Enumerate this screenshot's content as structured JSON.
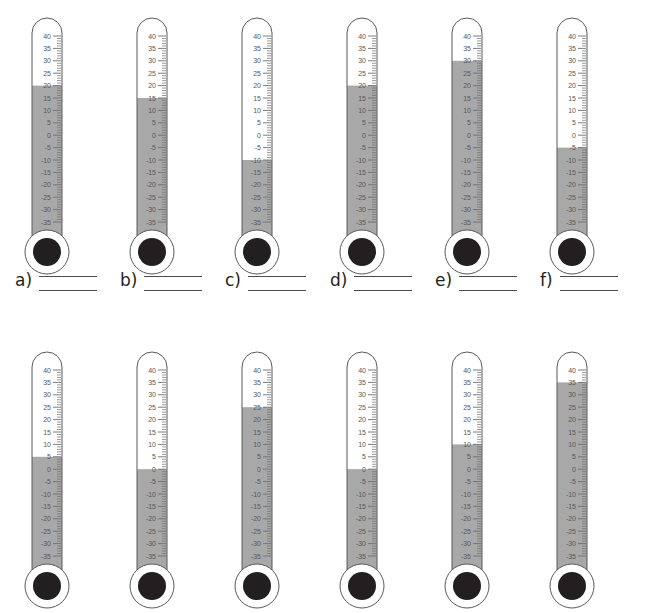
{
  "page": {
    "background_color": "#ffffff"
  },
  "style": {
    "mercury_color": "#a8a8a8",
    "outline_color": "#58595b",
    "tick_color": "#6d6e71",
    "label_color": "#58595b",
    "bulb_fill_color": "#231f20",
    "line_color": "#4a4a4a"
  },
  "scale": {
    "max": 40,
    "min": -35,
    "major_step": 5,
    "minor_per_major": 5,
    "labels": [
      "40",
      "35",
      "30",
      "25",
      "20",
      "15",
      "10",
      "5",
      "0",
      "-5",
      "-10",
      "-15",
      "-20",
      "-25",
      "-30",
      "-35"
    ],
    "unit": "degrees"
  },
  "rows": [
    {
      "name": "row-1",
      "thermometers": [
        {
          "id": "a",
          "letter": "a)",
          "reading": 20
        },
        {
          "id": "b",
          "letter": "b)",
          "reading": 15
        },
        {
          "id": "c",
          "letter": "c)",
          "reading": -10
        },
        {
          "id": "d",
          "letter": "d)",
          "reading": 20
        },
        {
          "id": "e",
          "letter": "e)",
          "reading": 30
        },
        {
          "id": "f",
          "letter": "f)",
          "reading": -5
        }
      ]
    },
    {
      "name": "row-2",
      "thermometers": [
        {
          "id": "g",
          "letter": "g)",
          "reading": 5
        },
        {
          "id": "h",
          "letter": "h)",
          "reading": 0
        },
        {
          "id": "i",
          "letter": "i)",
          "reading": 25
        },
        {
          "id": "j",
          "letter": "j)",
          "reading": 0
        },
        {
          "id": "k",
          "letter": "k)",
          "reading": 10
        },
        {
          "id": "l",
          "letter": "l)",
          "reading": 35
        }
      ]
    }
  ],
  "answer_lines": [
    {
      "letter": "a)"
    },
    {
      "letter": "b)"
    },
    {
      "letter": "c)"
    },
    {
      "letter": "d)"
    },
    {
      "letter": "e)"
    },
    {
      "letter": "f)"
    }
  ]
}
